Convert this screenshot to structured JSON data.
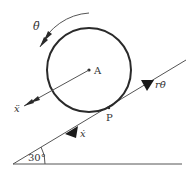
{
  "diagram": {
    "type": "rolling-disk-on-incline",
    "colors": {
      "stroke": "#2a2a2a",
      "thin_line": "#555555",
      "text": "#333333",
      "background": "#ffffff"
    },
    "labels": {
      "theta_ddot": "θ̈",
      "center": "A",
      "x_ddot": "ẍ",
      "contact": "P",
      "x_dot": "ẋ",
      "r_theta_dot": "rθ̇",
      "angle": "30°"
    },
    "incline_angle_deg": 30
  }
}
